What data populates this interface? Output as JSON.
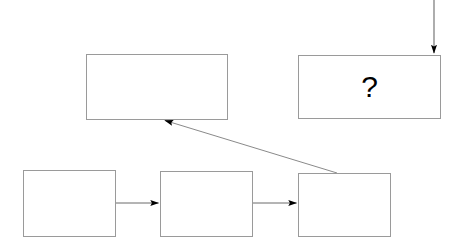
{
  "diagram": {
    "background_color": "#ffffff",
    "stroke_color": "#9a9a9a",
    "arrow_color": "#5a5a5a",
    "arrowhead_color": "#000000",
    "text_color": "#000000",
    "nodes": [
      {
        "id": "top-left-box",
        "name": "top-left-empty-box",
        "label": "",
        "x": 86,
        "y": 54,
        "w": 142,
        "h": 66
      },
      {
        "id": "question-box",
        "name": "question-mark-box",
        "label": "?",
        "x": 298,
        "y": 55,
        "w": 143,
        "h": 64
      },
      {
        "id": "bottom-box-1",
        "name": "bottom-left-empty-box",
        "label": "",
        "x": 23,
        "y": 170,
        "w": 93,
        "h": 67
      },
      {
        "id": "bottom-box-2",
        "name": "bottom-middle-empty-box",
        "label": "",
        "x": 160,
        "y": 171,
        "w": 93,
        "h": 66
      },
      {
        "id": "bottom-box-3",
        "name": "bottom-right-empty-box",
        "label": "",
        "x": 298,
        "y": 173,
        "w": 93,
        "h": 64
      }
    ],
    "connectors": [
      {
        "id": "incoming-top-arrow",
        "name": "incoming-vertical-arrow",
        "from": "outside-top",
        "to": "question-box",
        "x1": 434,
        "y1": 0,
        "x2": 434,
        "y2": 54,
        "direction": "down"
      },
      {
        "id": "arrow-box1-to-box2",
        "name": "arrow-bottom-1-to-2",
        "from": "bottom-box-1",
        "to": "bottom-box-2",
        "x1": 116,
        "y1": 203,
        "x2": 159,
        "y2": 203,
        "direction": "right"
      },
      {
        "id": "arrow-box2-to-box3",
        "name": "arrow-bottom-2-to-3",
        "from": "bottom-box-2",
        "to": "bottom-box-3",
        "x1": 253,
        "y1": 203,
        "x2": 297,
        "y2": 203,
        "direction": "right"
      },
      {
        "id": "arrow-box3-to-topleft",
        "name": "arrow-diagonal-to-top-left-box",
        "from": "bottom-box-3",
        "to": "top-left-box",
        "x1": 337,
        "y1": 173,
        "x2": 164,
        "y2": 120,
        "direction": "up-left"
      }
    ]
  }
}
